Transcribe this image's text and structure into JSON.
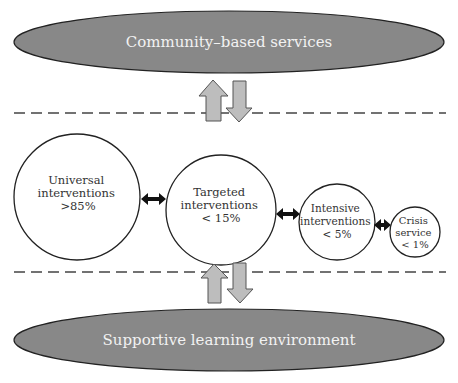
{
  "diagram": {
    "top_ellipse": {
      "label": "Community–based services",
      "fill": "#888888"
    },
    "bottom_ellipse": {
      "label": "Supportive learning environment",
      "fill": "#888888"
    },
    "arrow_fill": "#bdbdbd",
    "tiers": [
      {
        "line1": "Universal",
        "line2": "interventions",
        "line3": ">85%"
      },
      {
        "line1": "Targeted",
        "line2": "interventions",
        "line3": "< 15%"
      },
      {
        "line1": "Intensive",
        "line2": "interventions",
        "line3": "< 5%"
      },
      {
        "line1": "Crisis",
        "line2": "service",
        "line3": "< 1%"
      }
    ]
  }
}
